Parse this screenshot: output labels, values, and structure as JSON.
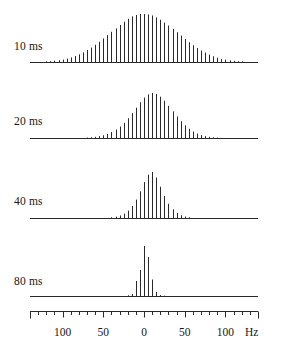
{
  "figure": {
    "title": "",
    "background_color": "#ffffff",
    "line_color": "#2a2a2a",
    "baseline_color": "#2a2a2a"
  },
  "axis": {
    "unit_label": "Hz",
    "tick_labels": [
      "100",
      "50",
      "0",
      "50",
      "100"
    ],
    "tick_values": [
      -100,
      -50,
      0,
      50,
      100
    ],
    "minor_tick_step": 10,
    "range_hz": [
      -140,
      140
    ],
    "baseline_x_px": [
      30,
      258
    ],
    "zero_x_px": 143
  },
  "panels": [
    {
      "label": "10 ms",
      "delay_ms": 10
    },
    {
      "label": "20 ms",
      "delay_ms": 20
    },
    {
      "label": "40 ms",
      "delay_ms": 40
    },
    {
      "label": "80 ms",
      "delay_ms": 80
    }
  ],
  "chart_data": {
    "type": "bar",
    "title": "",
    "xlabel": "Hz",
    "ylabel": "",
    "xlim": [
      -140,
      140
    ],
    "grid": false,
    "legend_position": "none",
    "categories": [
      -130,
      -125,
      -120,
      -115,
      -110,
      -105,
      -100,
      -95,
      -90,
      -85,
      -80,
      -75,
      -70,
      -65,
      -60,
      -55,
      -50,
      -45,
      -40,
      -35,
      -30,
      -25,
      -20,
      -15,
      -10,
      -5,
      0,
      5,
      10,
      15,
      20,
      25,
      30,
      35,
      40,
      45,
      50,
      55,
      60,
      65,
      70,
      75,
      80,
      85,
      90,
      95,
      100,
      105,
      110,
      115,
      120,
      125,
      130
    ],
    "series": [
      {
        "name": "10 ms",
        "line_spacing_hz": 5,
        "values": [
          0.5,
          0.8,
          1.2,
          1.8,
          2.6,
          3.6,
          5.0,
          7.0,
          9.5,
          12.5,
          16.0,
          20.0,
          25.0,
          30.0,
          36.0,
          42.0,
          49.0,
          56.0,
          63.0,
          70.0,
          77.0,
          84.0,
          90.0,
          95.0,
          98.0,
          100.0,
          100.0,
          99.0,
          97.0,
          93.0,
          88.0,
          82.0,
          76.0,
          69.0,
          62.0,
          55.0,
          48.0,
          41.0,
          35.0,
          29.0,
          24.0,
          19.5,
          15.5,
          12.0,
          9.0,
          6.5,
          4.8,
          3.4,
          2.4,
          1.7,
          1.2,
          0.8,
          0.5
        ]
      },
      {
        "name": "20 ms",
        "line_spacing_hz": 5,
        "values": [
          0.0,
          0.0,
          0.0,
          0.0,
          0.0,
          0.0,
          0.0,
          0.0,
          0.0,
          0.0,
          0.3,
          0.6,
          1.0,
          1.6,
          2.5,
          4.0,
          6.0,
          9.0,
          13.0,
          18.5,
          25.0,
          33.0,
          43.0,
          54.0,
          66.0,
          78.0,
          88.0,
          95.0,
          98.0,
          96.0,
          90.0,
          81.0,
          70.0,
          58.0,
          47.0,
          36.5,
          27.5,
          20.0,
          14.0,
          9.5,
          6.2,
          4.0,
          2.5,
          1.5,
          0.9,
          0.5,
          0.3,
          0.0,
          0.0,
          0.0,
          0.0,
          0.0,
          0.0
        ]
      },
      {
        "name": "40 ms",
        "line_spacing_hz": 5,
        "values": [
          0.0,
          0.0,
          0.0,
          0.0,
          0.0,
          0.0,
          0.0,
          0.0,
          0.0,
          0.0,
          0.0,
          0.0,
          0.0,
          0.0,
          0.0,
          0.0,
          0.0,
          0.8,
          1.6,
          3.0,
          5.5,
          9.5,
          16.0,
          26.0,
          40.0,
          58.0,
          78.0,
          94.0,
          100.0,
          88.0,
          68.0,
          48.0,
          31.0,
          19.0,
          11.0,
          6.0,
          3.2,
          1.6,
          0.8,
          0.4,
          0.0,
          0.0,
          0.0,
          0.0,
          0.0,
          0.0,
          0.0,
          0.0,
          0.0,
          0.0,
          0.0,
          0.0,
          0.0
        ]
      },
      {
        "name": "80 ms",
        "line_spacing_hz": 5,
        "values": [
          0.0,
          0.0,
          0.0,
          0.0,
          0.0,
          0.0,
          0.0,
          0.0,
          0.0,
          0.0,
          0.0,
          0.0,
          0.0,
          0.0,
          0.0,
          0.0,
          0.0,
          0.0,
          0.0,
          0.0,
          0.0,
          0.0,
          1.5,
          4.0,
          30.0,
          52.0,
          100.0,
          78.0,
          33.0,
          8.0,
          2.0,
          0.8,
          0.0,
          0.0,
          0.0,
          0.0,
          0.0,
          0.0,
          0.0,
          0.0,
          0.0,
          0.0,
          0.0,
          0.0,
          0.0,
          0.0,
          0.0,
          0.0,
          0.0,
          0.0,
          0.0,
          0.0,
          0.0
        ]
      }
    ]
  }
}
